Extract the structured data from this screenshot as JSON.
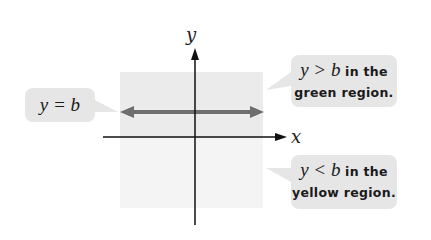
{
  "diagram": {
    "axes": {
      "x_label": "x",
      "y_label": "y"
    },
    "line_label": "y = b",
    "callouts": {
      "top": {
        "math": "y > b",
        "text1": " in the",
        "text2": "green region."
      },
      "bottom": {
        "math": "y < b",
        "text1": " in the",
        "text2": "yellow region."
      }
    },
    "colors": {
      "upper_region": "#ebebeb",
      "lower_region": "#f4f4f4",
      "boundary_line": "#6e6e6e",
      "axes": "#111111",
      "callout_bg": "#e6e6e6"
    }
  }
}
